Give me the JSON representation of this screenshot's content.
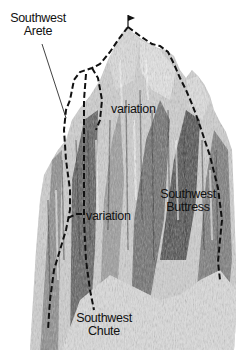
{
  "diagram": {
    "colors": {
      "background": "#ffffff",
      "route_line": "#111111",
      "rock_dark": "#3a3a3a",
      "rock_mid": "#7a7a7a",
      "rock_light": "#c8c8c8",
      "snow": "#eeeeee"
    },
    "summit_icon": "flag-icon",
    "labels": {
      "southwest_arete": {
        "line1": "Southwest",
        "line2": "Arete"
      },
      "variation_upper": {
        "text": "variation"
      },
      "variation_lower": {
        "text": "variation"
      },
      "southwest_buttress": {
        "line1": "Southwest",
        "line2": "Buttress"
      },
      "southwest_chute": {
        "line1": "Southwest",
        "line2": "Chute"
      }
    },
    "routes": [
      {
        "name": "Southwest Arete",
        "style": "dashed"
      },
      {
        "name": "Southwest Buttress",
        "style": "dashed"
      },
      {
        "name": "Southwest Chute",
        "style": "dashed"
      },
      {
        "name": "variation",
        "style": "dashed"
      },
      {
        "name": "variation",
        "style": "dashed"
      }
    ]
  }
}
